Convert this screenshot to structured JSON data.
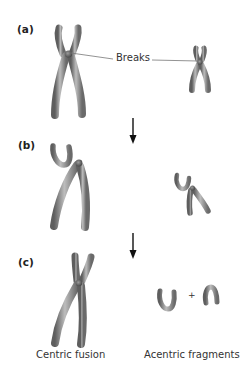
{
  "panels": [
    {
      "id": "a",
      "label": "(a)"
    },
    {
      "id": "b",
      "label": "(b)"
    },
    {
      "id": "c",
      "label": "(c)"
    }
  ],
  "annotations": {
    "breaks": "Breaks",
    "plus": "+",
    "centric_fusion": "Centric fusion",
    "acentric_fragments": "Acentric fragments"
  },
  "colors": {
    "chromosome_dark": "#6e6e6e",
    "chromosome_light": "#c8c8c8",
    "arrow": "#111111",
    "leader_line": "#777777",
    "text": "#333333"
  }
}
